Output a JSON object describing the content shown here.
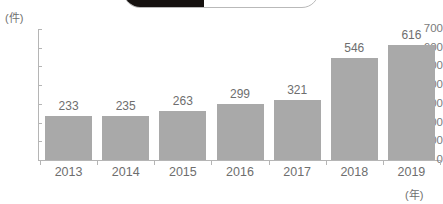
{
  "overlay": {
    "badge": {
      "name": "rounded-badge-cropped",
      "left_fill": "#15110f",
      "right_fill": "#ffffff",
      "border": "#b9b9b9"
    }
  },
  "chart_data": {
    "type": "bar",
    "title": "",
    "subtitle": "",
    "xlabel": "(年)",
    "ylabel": "(件)",
    "categories": [
      "2013",
      "2014",
      "2015",
      "2016",
      "2017",
      "2018",
      "2019"
    ],
    "values": [
      233,
      235,
      263,
      299,
      321,
      546,
      616
    ],
    "value_labels": [
      "233",
      "235",
      "263",
      "299",
      "321",
      "546",
      "616"
    ],
    "ylim": [
      0,
      700
    ],
    "ytick_labels": [
      "700",
      "600",
      "500",
      "400",
      "300",
      "200",
      "100",
      "0"
    ],
    "ytick_values": [
      700,
      600,
      500,
      400,
      300,
      200,
      100,
      0
    ],
    "grid": false,
    "legend": null,
    "legend_position": "none",
    "series": [
      {
        "name": "件数",
        "values": [
          233,
          235,
          263,
          299,
          321,
          546,
          616
        ],
        "color": "#a9a9a9"
      }
    ],
    "colors": {
      "bar": "#a9a9a9",
      "axis": "#b5b5b5",
      "text": "#6e6e6e",
      "background": "#ffffff"
    }
  }
}
